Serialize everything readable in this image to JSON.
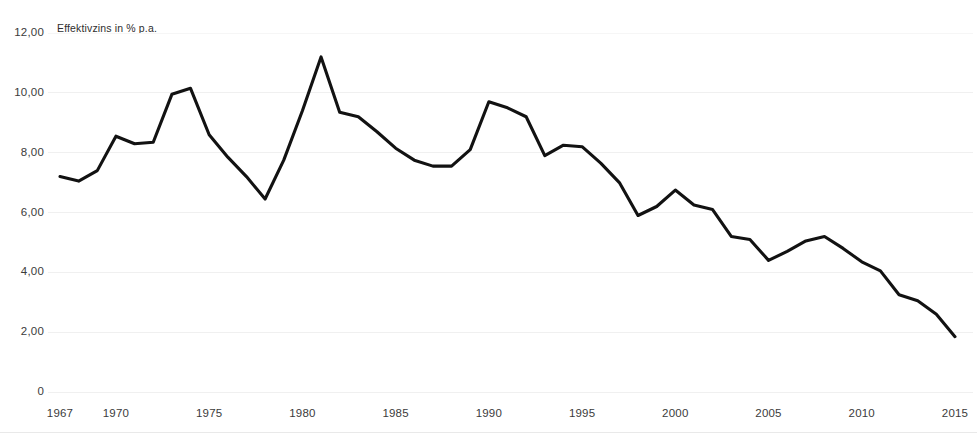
{
  "chart_data": {
    "type": "line",
    "title": "",
    "subtitle": "",
    "axis_caption": "Effektivzins in % p.a.",
    "xlabel": "",
    "ylabel": "Effektivzins in % p.a.",
    "ylim": [
      0,
      12
    ],
    "xlim": [
      1967,
      2015
    ],
    "grid": true,
    "legend": "none",
    "y_ticks": [
      "0",
      "2,00",
      "4,00",
      "6,00",
      "8,00",
      "10,00",
      "12,00"
    ],
    "y_tick_values": [
      0,
      2,
      4,
      6,
      8,
      10,
      12
    ],
    "x_ticks": [
      "1967",
      "1970",
      "1975",
      "1980",
      "1985",
      "1990",
      "1995",
      "2000",
      "2005",
      "2010",
      "2015"
    ],
    "x_tick_values": [
      1967,
      1970,
      1975,
      1980,
      1985,
      1990,
      1995,
      2000,
      2005,
      2010,
      2015
    ],
    "series": [
      {
        "name": "Effektivzins",
        "color": "#121212",
        "x": [
          1967,
          1968,
          1969,
          1970,
          1971,
          1972,
          1973,
          1974,
          1975,
          1976,
          1977,
          1978,
          1979,
          1980,
          1981,
          1982,
          1983,
          1984,
          1985,
          1986,
          1987,
          1988,
          1989,
          1990,
          1991,
          1992,
          1993,
          1994,
          1995,
          1996,
          1997,
          1998,
          1999,
          2000,
          2001,
          2002,
          2003,
          2004,
          2005,
          2006,
          2007,
          2008,
          2009,
          2010,
          2011,
          2012,
          2013,
          2014,
          2015
        ],
        "values": [
          7.2,
          7.05,
          7.4,
          8.55,
          8.3,
          8.35,
          9.95,
          10.15,
          8.6,
          7.85,
          7.2,
          6.45,
          7.75,
          9.4,
          11.2,
          9.35,
          9.2,
          8.7,
          8.15,
          7.75,
          7.55,
          7.55,
          8.1,
          9.7,
          9.5,
          9.2,
          7.9,
          8.25,
          8.2,
          7.65,
          7.0,
          5.9,
          6.2,
          6.75,
          6.25,
          6.1,
          5.2,
          5.1,
          4.4,
          4.7,
          5.05,
          5.2,
          4.8,
          4.35,
          4.05,
          3.25,
          3.05,
          2.6,
          1.85
        ]
      }
    ]
  },
  "colors": {
    "line": "#121212",
    "grid": "#f0f0f0",
    "text": "#3b3b3b",
    "background": "#ffffff"
  }
}
